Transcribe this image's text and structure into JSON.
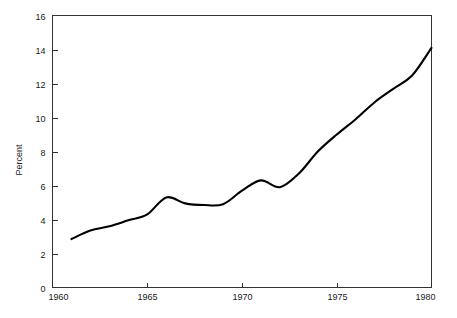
{
  "chart_data": {
    "type": "line",
    "title": "",
    "subtitle": "",
    "xlabel": "",
    "ylabel": "Percent",
    "xlim": [
      1960,
      1980
    ],
    "ylim": [
      0,
      16
    ],
    "grid": false,
    "legend": null,
    "x_ticks": [
      1960,
      1965,
      1970,
      1975,
      1980
    ],
    "x_tick_labels": [
      "1960",
      "1965",
      "1970",
      "1975",
      "1980"
    ],
    "y_ticks": [
      0,
      2,
      4,
      6,
      8,
      10,
      12,
      14,
      16
    ],
    "y_tick_labels": [
      "0",
      "2",
      "4",
      "6",
      "8",
      "10",
      "12",
      "14",
      "16"
    ],
    "series": [
      {
        "name": "Percent",
        "color": "#000000",
        "x": [
          1961,
          1962,
          1963,
          1964,
          1965,
          1966,
          1967,
          1968,
          1969,
          1970,
          1971,
          1972,
          1973,
          1974,
          1975,
          1976,
          1977,
          1978,
          1979,
          1980
        ],
        "values": [
          2.85,
          3.35,
          3.6,
          3.95,
          4.3,
          5.3,
          4.95,
          4.85,
          4.9,
          5.7,
          6.3,
          5.9,
          6.7,
          8.0,
          9.0,
          9.9,
          10.9,
          11.7,
          12.5,
          14.1
        ]
      }
    ],
    "annotations": []
  },
  "axis": {
    "y_title": "Percent"
  }
}
